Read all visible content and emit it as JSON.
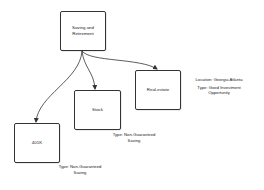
{
  "diagram": {
    "type": "tree",
    "root": {
      "id": "saving-retirement",
      "label_lines": [
        "Saving and",
        "Retirement"
      ]
    },
    "nodes": [
      {
        "id": "real-estate",
        "label": "Real-estate",
        "annotation_lines": [
          "Location: Georgia Atlanta",
          "Type: Good Investment",
          "Opportunity"
        ]
      },
      {
        "id": "stock",
        "label": "Stock",
        "annotation_lines": [
          "Type: Non-Guaranteed",
          "Saving"
        ]
      },
      {
        "id": "401k",
        "label": "401K",
        "annotation_lines": [
          "Type: Non-Guaranteed",
          "Saving"
        ]
      }
    ],
    "edges": [
      {
        "from": "saving-retirement",
        "to": "real-estate"
      },
      {
        "from": "saving-retirement",
        "to": "stock"
      },
      {
        "from": "saving-retirement",
        "to": "401k"
      }
    ],
    "colors": {
      "stroke": "#333333",
      "text": "#222222",
      "background": "#ffffff"
    }
  }
}
